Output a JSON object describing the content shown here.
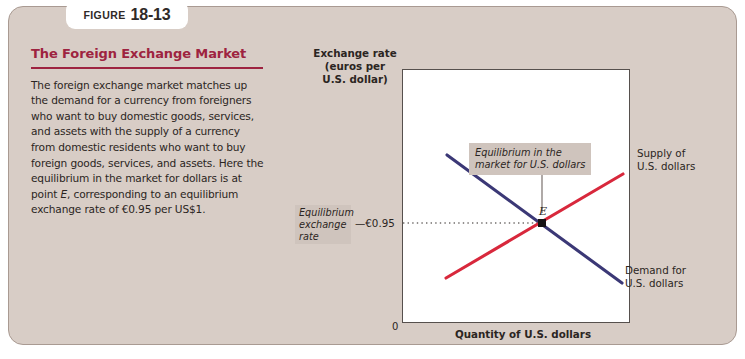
{
  "figure": {
    "tab_word": "Figure",
    "tab_number": "18-13",
    "title": "The Foreign Exchange Market",
    "body": "The foreign exchange market matches up the demand for a currency from foreigners who want to buy domestic goods, services, and assets with the supply of a currency from domestic residents who want to buy foreign goods, services, and assets. Here the equilibrium in the market for dollars is at point E, corresponding to an equilibrium exchange rate of €0.95 per US$1."
  },
  "colors": {
    "panel_background": "#d8cdc6",
    "panel_border": "#a99a92",
    "title_accent": "#9e2340",
    "supply_curve": "#d8283c",
    "demand_curve": "#3b3876",
    "plot_border": "#56504d",
    "label_box": "#cfc4bd",
    "equilibrium_point": "#161214"
  },
  "chart_data": {
    "type": "line",
    "title": "The Foreign Exchange Market",
    "xlabel": "Quantity of U.S. dollars",
    "ylabel": "Exchange rate (euros per U.S. dollar)",
    "ylabel_line1": "Exchange rate",
    "ylabel_line2": "(euros per",
    "ylabel_line3": "U.S. dollar)",
    "origin_label": "0",
    "grid": false,
    "legend_position": "inline-curve-labels",
    "xlim": [
      0,
      1
    ],
    "ylim": [
      0,
      1
    ],
    "series": [
      {
        "name": "Demand for U.S. dollars",
        "color": "#3b3876",
        "slope": "downward",
        "points": [
          [
            0.145,
            0.915
          ],
          [
            0.92,
            0.2
          ]
        ],
        "label_line1": "Demand for",
        "label_line2": "U.S. dollars"
      },
      {
        "name": "Supply of U.S. dollars",
        "color": "#d8283c",
        "slope": "upward",
        "points": [
          [
            0.135,
            0.115
          ],
          [
            0.93,
            0.845
          ]
        ],
        "label_line1": "Supply of",
        "label_line2": "U.S. dollars"
      }
    ],
    "equilibrium": {
      "point_label": "E",
      "y_value": "€0.95",
      "y_tick_text": "—€0.95",
      "rate_note_line1": "Equilibrium",
      "rate_note_line2": "exchange",
      "rate_note_line3": "rate",
      "callout_line1": "Equilibrium in the",
      "callout_line2": "market for U.S. dollars",
      "dotted_guide": true
    }
  }
}
